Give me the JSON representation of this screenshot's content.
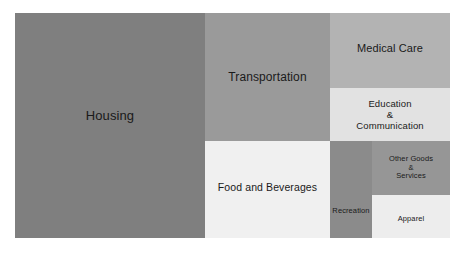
{
  "chart_data": {
    "type": "treemap",
    "title": "",
    "subtitle": "",
    "xlabel": "",
    "ylabel": "",
    "grid": false,
    "legend": "none",
    "background": "#ffffff",
    "categories": [
      "Housing",
      "Transportation",
      "Food and Beverages",
      "Medical Care",
      "Education & Communication",
      "Recreation",
      "Other Goods & Services",
      "Apparel"
    ],
    "values": [
      42.4,
      15.9,
      13.4,
      8.5,
      6.0,
      5.7,
      3.3,
      3.0
    ],
    "tiles": [
      {
        "id": "housing",
        "label": "Housing",
        "value": 42.4,
        "color": "#7f7f7f"
      },
      {
        "id": "transportation",
        "label": "Transportation",
        "value": 15.9,
        "color": "#9a9a9a"
      },
      {
        "id": "food-and-beverages",
        "label": "Food and Beverages",
        "value": 13.4,
        "color": "#f0f0f0"
      },
      {
        "id": "medical-care",
        "label": "Medical Care",
        "value": 8.5,
        "color": "#b3b3b3"
      },
      {
        "id": "education-and-communication",
        "label": "Education\n&\nCommunication",
        "value": 6.0,
        "color": "#e2e2e2"
      },
      {
        "id": "recreation",
        "label": "Recreation",
        "value": 5.7,
        "color": "#8b8b8b"
      },
      {
        "id": "other-goods-and-services",
        "label": "Other Goods\n&\nServices",
        "value": 3.3,
        "color": "#969696"
      },
      {
        "id": "apparel",
        "label": "Apparel",
        "value": 3.0,
        "color": "#ededed"
      }
    ]
  }
}
